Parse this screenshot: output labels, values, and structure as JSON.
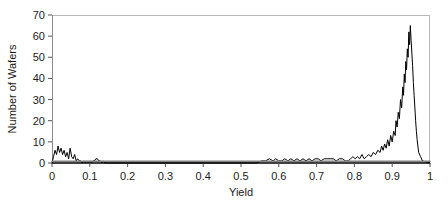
{
  "chart_data": {
    "type": "line",
    "title": "",
    "subtitle": "",
    "xlabel": "Yield",
    "ylabel": "Number of Wafers",
    "xlim": [
      0,
      1
    ],
    "ylim": [
      0,
      70
    ],
    "xticks": [
      0,
      0.1,
      0.2,
      0.3,
      0.4,
      0.5,
      0.6,
      0.7,
      0.8,
      0.9,
      1
    ],
    "xticklabels": [
      "0",
      "0.1",
      "0.2",
      "0.3",
      "0.4",
      "0.5",
      "0.6",
      "0.7",
      "0.8",
      "0.9",
      "1"
    ],
    "yticks": [
      0,
      10,
      20,
      30,
      40,
      50,
      60,
      70
    ],
    "yticklabels": [
      "0",
      "10",
      "20",
      "30",
      "40",
      "50",
      "60",
      "70"
    ],
    "grid": false,
    "legend": null,
    "legend_position": "none",
    "series": [
      {
        "name": "Number of Wafers",
        "color": "#000000",
        "x": [
          0.0,
          0.004,
          0.008,
          0.012,
          0.016,
          0.02,
          0.024,
          0.028,
          0.032,
          0.036,
          0.04,
          0.044,
          0.048,
          0.052,
          0.056,
          0.06,
          0.064,
          0.068,
          0.072,
          0.076,
          0.08,
          0.084,
          0.088,
          0.092,
          0.096,
          0.1,
          0.104,
          0.108,
          0.112,
          0.116,
          0.12,
          0.124,
          0.128,
          0.132,
          0.136,
          0.14,
          0.15,
          0.16,
          0.17,
          0.18,
          0.19,
          0.2,
          0.22,
          0.24,
          0.26,
          0.28,
          0.3,
          0.32,
          0.34,
          0.36,
          0.38,
          0.4,
          0.42,
          0.44,
          0.46,
          0.48,
          0.5,
          0.52,
          0.54,
          0.555,
          0.565,
          0.575,
          0.585,
          0.592,
          0.6,
          0.608,
          0.616,
          0.624,
          0.632,
          0.64,
          0.648,
          0.656,
          0.664,
          0.672,
          0.68,
          0.688,
          0.696,
          0.704,
          0.712,
          0.72,
          0.728,
          0.736,
          0.744,
          0.752,
          0.76,
          0.768,
          0.776,
          0.784,
          0.79,
          0.796,
          0.802,
          0.808,
          0.814,
          0.82,
          0.826,
          0.832,
          0.838,
          0.844,
          0.85,
          0.856,
          0.862,
          0.868,
          0.872,
          0.876,
          0.88,
          0.884,
          0.888,
          0.892,
          0.896,
          0.9,
          0.904,
          0.908,
          0.91,
          0.913,
          0.916,
          0.919,
          0.922,
          0.925,
          0.928,
          0.93,
          0.932,
          0.934,
          0.936,
          0.938,
          0.94,
          0.942,
          0.944,
          0.946,
          0.948,
          0.95,
          0.952,
          0.954,
          0.956,
          0.958,
          0.96,
          0.962,
          0.964,
          0.966,
          0.968,
          0.97,
          0.975,
          0.98,
          1.0
        ],
        "values": [
          0,
          3,
          6,
          4,
          8,
          5,
          7,
          4,
          6,
          3,
          5,
          2,
          7,
          3,
          2,
          4,
          1,
          2,
          1,
          1,
          0,
          1,
          0,
          1,
          0,
          1,
          0,
          1,
          1,
          2,
          2,
          1,
          1,
          0,
          1,
          0,
          0,
          0,
          0,
          0,
          0,
          0,
          0,
          0,
          0,
          0,
          0,
          0,
          0,
          0,
          0,
          0,
          0,
          0,
          0,
          0,
          0,
          0,
          0,
          1,
          1,
          2,
          1,
          2,
          1,
          1,
          2,
          1,
          2,
          1,
          2,
          1,
          2,
          1,
          2,
          1,
          2,
          2,
          1,
          2,
          2,
          2,
          2,
          1,
          2,
          2,
          1,
          1,
          2,
          3,
          2,
          3,
          2,
          4,
          2,
          3,
          4,
          3,
          5,
          4,
          6,
          5,
          8,
          6,
          9,
          7,
          11,
          8,
          13,
          10,
          15,
          13,
          20,
          17,
          24,
          21,
          30,
          26,
          36,
          32,
          42,
          38,
          48,
          44,
          54,
          50,
          62,
          56,
          65,
          58,
          52,
          46,
          38,
          32,
          26,
          20,
          15,
          11,
          8,
          5,
          3,
          1,
          0
        ]
      },
      {
        "name": "baseline",
        "color": "#808080",
        "x": [
          0,
          1
        ],
        "values": [
          0.8,
          0.8
        ]
      }
    ]
  },
  "axes": {
    "frame_color": "#b5b5b5",
    "axis_color": "#000000",
    "tick_color": "#555555"
  }
}
